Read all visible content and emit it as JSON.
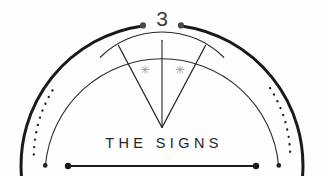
{
  "emblem": {
    "numeral": "3",
    "title": "THE SIGNS",
    "star_left": "✳",
    "star_right": "✳",
    "colors": {
      "background": "#fefefe",
      "outer_arc": "#1a1a1a",
      "inner_arc": "#2b2b2b",
      "dotted_arc": "#1f1f1f",
      "wedge_line": "#262626",
      "baseline_rule": "#1a1a1a",
      "numeral": "#3a3a3a",
      "title": "#262626",
      "star": "#9b9b9b",
      "cap_dot": "#4a4a4a"
    },
    "geometry": {
      "center_x": 162,
      "baseline_y": 166,
      "outer_radius": 141,
      "inner_radius": 117,
      "dotted_radius": 129,
      "wedge_radius": 88,
      "rule_start_x": 68,
      "rule_end_x": 256
    }
  }
}
